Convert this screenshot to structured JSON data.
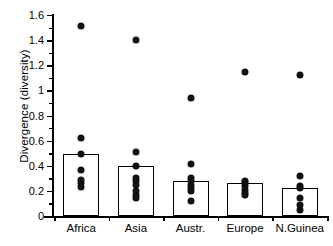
{
  "chart_data": {
    "type": "bar",
    "title": "",
    "xlabel": "",
    "ylabel": "Divergence (diversity)",
    "ylim": [
      0,
      1.6
    ],
    "ytick_step": 0.2,
    "minor_ticks": true,
    "grid": false,
    "legend": "none",
    "categories": [
      "Africa",
      "Asia",
      "Austr.",
      "Europe",
      "N.Guinea"
    ],
    "ytick_labels": [
      "0",
      "0.2",
      "0.4",
      "0.6",
      "0.8",
      "1",
      "1.2",
      "1.4",
      "1.6"
    ],
    "ytick_values": [
      0,
      0.2,
      0.4,
      0.6,
      0.8,
      1,
      1.2,
      1.4,
      1.6
    ],
    "values": [
      0.49,
      0.395,
      0.275,
      0.26,
      0.22
    ],
    "series": [
      {
        "name": "Mean divergence (bar)",
        "values": [
          0.49,
          0.395,
          0.275,
          0.26,
          0.22
        ]
      }
    ],
    "overlay": {
      "type": "scatter",
      "marker": "filled-circle",
      "color": "#111111",
      "points": {
        "Africa": [
          1.51,
          0.62,
          0.49,
          0.37,
          0.29,
          0.26,
          0.23
        ],
        "Asia": [
          1.4,
          0.51,
          0.395,
          0.3,
          0.28,
          0.25,
          0.2,
          0.17,
          0.145
        ],
        "Austr.": [
          0.94,
          0.415,
          0.3,
          0.275,
          0.25,
          0.225,
          0.2,
          0.12
        ],
        "Europe": [
          1.15,
          0.275,
          0.26,
          0.235,
          0.205,
          0.185,
          0.165
        ],
        "N.Guinea": [
          1.12,
          0.315,
          0.235,
          0.22,
          0.145,
          0.085,
          0.05
        ]
      }
    },
    "colors": {
      "bar_face": "#ffffff",
      "bar_edge": "#000000",
      "point": "#111111",
      "axis": "#000000"
    }
  }
}
